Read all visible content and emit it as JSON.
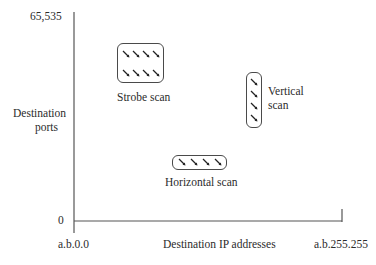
{
  "diagram": {
    "y_axis": {
      "label_line1": "Destination",
      "label_line2": "ports",
      "max_tick": "65,535",
      "min_tick": "0"
    },
    "x_axis": {
      "label": "Destination IP addresses",
      "min_tick": "a.b.0.0",
      "max_tick": "a.b.255.255"
    },
    "regions": [
      {
        "name": "strobe",
        "label": "Strobe scan",
        "rows": 2,
        "cols": 4
      },
      {
        "name": "vertical",
        "label_line1": "Vertical",
        "label_line2": "scan",
        "rows": 4,
        "cols": 1
      },
      {
        "name": "horizontal",
        "label": "Horizontal scan",
        "rows": 1,
        "cols": 4
      }
    ],
    "marker_icon": "arrow-down-right-icon"
  }
}
